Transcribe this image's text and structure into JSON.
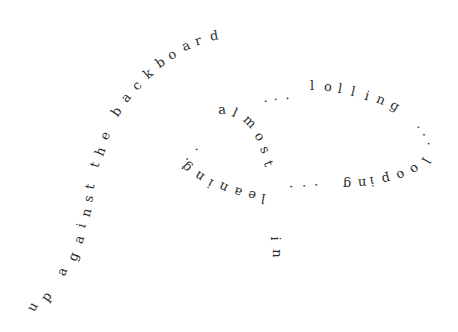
{
  "poem": {
    "full_text": "up against the backboard ... almost ... lolling ... looping ... leaning in",
    "phrases": [
      "up against the backboard",
      "almost",
      "lolling",
      "looping",
      "leaning",
      "in"
    ],
    "text_color": "#2b2b2b",
    "background": "#ffffff"
  },
  "glyphs": [
    {
      "c": "u",
      "x": 32,
      "y": 307,
      "r": -60
    },
    {
      "c": "p",
      "x": 46,
      "y": 297,
      "r": -55
    },
    {
      "c": "a",
      "x": 62,
      "y": 272,
      "r": -68
    },
    {
      "c": "g",
      "x": 73,
      "y": 257,
      "r": -70
    },
    {
      "c": "a",
      "x": 79,
      "y": 240,
      "r": -72
    },
    {
      "c": "i",
      "x": 83,
      "y": 226,
      "r": -74
    },
    {
      "c": "n",
      "x": 86,
      "y": 213,
      "r": -76
    },
    {
      "c": "s",
      "x": 89,
      "y": 199,
      "r": -78
    },
    {
      "c": "t",
      "x": 91,
      "y": 187,
      "r": -78
    },
    {
      "c": "t",
      "x": 96,
      "y": 165,
      "r": -72
    },
    {
      "c": "h",
      "x": 100,
      "y": 152,
      "r": -68
    },
    {
      "c": "e",
      "x": 105,
      "y": 136,
      "r": -64
    },
    {
      "c": "b",
      "x": 116,
      "y": 112,
      "r": -55
    },
    {
      "c": "a",
      "x": 126,
      "y": 98,
      "r": -50
    },
    {
      "c": "c",
      "x": 137,
      "y": 86,
      "r": -45
    },
    {
      "c": "k",
      "x": 148,
      "y": 74,
      "r": -40
    },
    {
      "c": "b",
      "x": 160,
      "y": 63,
      "r": -34
    },
    {
      "c": "o",
      "x": 172,
      "y": 55,
      "r": -28
    },
    {
      "c": "a",
      "x": 186,
      "y": 46,
      "r": -22
    },
    {
      "c": "r",
      "x": 199,
      "y": 41,
      "r": -16
    },
    {
      "c": "d",
      "x": 214,
      "y": 36,
      "r": -10
    },
    {
      "c": ".",
      "x": 181,
      "y": 167,
      "r": -60
    },
    {
      "c": ".",
      "x": 186,
      "y": 157,
      "r": -50
    },
    {
      "c": ".",
      "x": 196,
      "y": 147,
      "r": -40
    },
    {
      "c": "a",
      "x": 222,
      "y": 110,
      "r": -5
    },
    {
      "c": "l",
      "x": 237,
      "y": 113,
      "r": 25
    },
    {
      "c": "m",
      "x": 248,
      "y": 122,
      "r": 45
    },
    {
      "c": "o",
      "x": 260,
      "y": 137,
      "r": 55
    },
    {
      "c": "s",
      "x": 266,
      "y": 150,
      "r": 65
    },
    {
      "c": "t",
      "x": 270,
      "y": 164,
      "r": 70
    },
    {
      "c": ".",
      "x": 267,
      "y": 98,
      "r": -10
    },
    {
      "c": ".",
      "x": 277,
      "y": 96,
      "r": -8
    },
    {
      "c": ".",
      "x": 289,
      "y": 95,
      "r": -5
    },
    {
      "c": "l",
      "x": 314,
      "y": 86,
      "r": 0
    },
    {
      "c": "o",
      "x": 328,
      "y": 87,
      "r": 4
    },
    {
      "c": "l",
      "x": 342,
      "y": 89,
      "r": 10
    },
    {
      "c": "l",
      "x": 355,
      "y": 92,
      "r": 14
    },
    {
      "c": "i",
      "x": 369,
      "y": 96,
      "r": 18
    },
    {
      "c": "n",
      "x": 381,
      "y": 100,
      "r": 22
    },
    {
      "c": "g",
      "x": 395,
      "y": 106,
      "r": 28
    },
    {
      "c": ".",
      "x": 423,
      "y": 125,
      "r": 45
    },
    {
      "c": ".",
      "x": 429,
      "y": 133,
      "r": 55
    },
    {
      "c": ".",
      "x": 434,
      "y": 143,
      "r": 70
    },
    {
      "c": "l",
      "x": 428,
      "y": 161,
      "r": 120
    },
    {
      "c": "o",
      "x": 415,
      "y": 170,
      "r": 140
    },
    {
      "c": "o",
      "x": 401,
      "y": 176,
      "r": 155
    },
    {
      "c": "p",
      "x": 386,
      "y": 180,
      "r": 165
    },
    {
      "c": "i",
      "x": 374,
      "y": 182,
      "r": 170
    },
    {
      "c": "n",
      "x": 362,
      "y": 184,
      "r": 175
    },
    {
      "c": "g",
      "x": 347,
      "y": 185,
      "r": 180
    },
    {
      "c": ".",
      "x": 318,
      "y": 189,
      "r": 180
    },
    {
      "c": ".",
      "x": 306,
      "y": 190,
      "r": 180
    },
    {
      "c": ".",
      "x": 293,
      "y": 191,
      "r": 182
    },
    {
      "c": "l",
      "x": 265,
      "y": 199,
      "r": 190
    },
    {
      "c": "e",
      "x": 252,
      "y": 196,
      "r": 195
    },
    {
      "c": "a",
      "x": 238,
      "y": 193,
      "r": 200
    },
    {
      "c": "n",
      "x": 223,
      "y": 188,
      "r": 205
    },
    {
      "c": "i",
      "x": 212,
      "y": 184,
      "r": 210
    },
    {
      "c": "n",
      "x": 199,
      "y": 177,
      "r": 215
    },
    {
      "c": "g",
      "x": 186,
      "y": 168,
      "r": 225
    },
    {
      "c": "i",
      "x": 277,
      "y": 239,
      "r": 90
    },
    {
      "c": "n",
      "x": 277,
      "y": 254,
      "r": 90
    }
  ]
}
